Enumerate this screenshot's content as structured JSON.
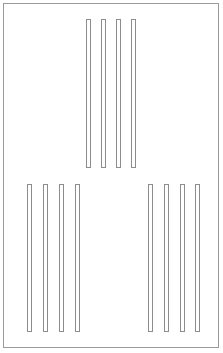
{
  "canvas": {
    "width": 223,
    "height": 353,
    "background_color": "#ffffff"
  },
  "frame": {
    "label": "outer-frame",
    "x": 3,
    "y": 3,
    "width": 216,
    "height": 345,
    "border_color": "#9a9a9a",
    "border_width": 1,
    "fill_color": "#ffffff"
  },
  "style": {
    "bar_border_color": "#8c8c8c",
    "bar_fill_color": "#ffffff",
    "bar_border_width": 1
  },
  "groups": [
    {
      "label": "top-center-group",
      "position": "upper-center",
      "bar_count": 4,
      "bar_width": 5,
      "bar_top": 19,
      "bar_height": 149,
      "bar_x_positions": [
        86,
        101,
        116,
        131
      ],
      "bars": [
        {
          "label": "bar-1",
          "x": 86,
          "y": 19,
          "width": 5,
          "height": 149
        },
        {
          "label": "bar-2",
          "x": 101,
          "y": 19,
          "width": 5,
          "height": 149
        },
        {
          "label": "bar-3",
          "x": 116,
          "y": 19,
          "width": 5,
          "height": 149
        },
        {
          "label": "bar-4",
          "x": 131,
          "y": 19,
          "width": 5,
          "height": 149
        }
      ]
    },
    {
      "label": "bottom-left-group",
      "position": "lower-left",
      "bar_count": 4,
      "bar_width": 5,
      "bar_top": 184,
      "bar_height": 148,
      "bar_x_positions": [
        27,
        43,
        59,
        75
      ],
      "bars": [
        {
          "label": "bar-1",
          "x": 27,
          "y": 184,
          "width": 5,
          "height": 148
        },
        {
          "label": "bar-2",
          "x": 43,
          "y": 184,
          "width": 5,
          "height": 148
        },
        {
          "label": "bar-3",
          "x": 59,
          "y": 184,
          "width": 5,
          "height": 148
        },
        {
          "label": "bar-4",
          "x": 75,
          "y": 184,
          "width": 5,
          "height": 148
        }
      ]
    },
    {
      "label": "bottom-right-group",
      "position": "lower-right",
      "bar_count": 4,
      "bar_width": 5,
      "bar_top": 184,
      "bar_height": 148,
      "bar_x_positions": [
        148,
        164,
        180,
        195
      ],
      "bars": [
        {
          "label": "bar-1",
          "x": 148,
          "y": 184,
          "width": 5,
          "height": 148
        },
        {
          "label": "bar-2",
          "x": 164,
          "y": 184,
          "width": 5,
          "height": 148
        },
        {
          "label": "bar-3",
          "x": 180,
          "y": 184,
          "width": 5,
          "height": 148
        },
        {
          "label": "bar-4",
          "x": 195,
          "y": 184,
          "width": 5,
          "height": 148
        }
      ]
    }
  ]
}
